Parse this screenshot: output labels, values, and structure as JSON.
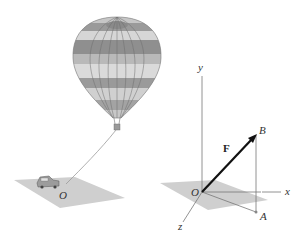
{
  "figure": {
    "left_scene": {
      "description": "hot air balloon tethered by a rope to a car on the ground",
      "origin_label": "O"
    },
    "right_scene": {
      "description": "3D coordinate axes with force vector F from O to B, B projected vertically to A on ground plane",
      "axes": {
        "x_label": "x",
        "y_label": "y",
        "z_label": "z"
      },
      "origin_label": "O",
      "point_b_label": "B",
      "point_a_label": "A",
      "vector_label": "F"
    },
    "colors": {
      "balloon_light": "#d4d4d4",
      "balloon_dark": "#8f8f8f",
      "balloon_mid": "#b0b0b0",
      "ground_plane": "#cfcfcf",
      "axis": "#777777",
      "vector": "#111111"
    }
  }
}
